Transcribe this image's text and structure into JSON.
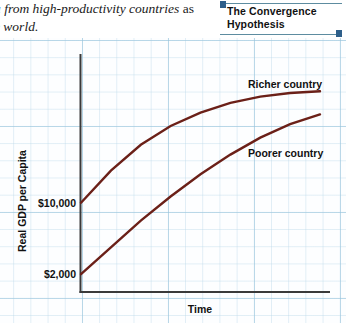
{
  "prose": {
    "line1": "a from high-productivity countries",
    "line1_tail": "as",
    "line2": "e world."
  },
  "callout": {
    "title": "The Convergence Hypothesis",
    "rule_color": "#5d8ca0",
    "marker_color": "#2e5f8a"
  },
  "chart_data": {
    "type": "line",
    "title": "The Convergence Hypothesis",
    "xlabel": "Time",
    "ylabel": "Real GDP per Capita",
    "grid": true,
    "legend_position": "inline-right",
    "x": [
      0,
      0.125,
      0.25,
      0.375,
      0.5,
      0.625,
      0.75,
      0.875,
      1.0
    ],
    "xlim": [
      0,
      1
    ],
    "ylim": [
      0,
      26000
    ],
    "ytick_labels": [
      "$10,000",
      "$2,000"
    ],
    "ytick_values": [
      10000,
      2000
    ],
    "line_color": "#6b2018",
    "axis_color": "#3a3a3a",
    "series": [
      {
        "name": "Richer country",
        "start_value": 10000,
        "end_value": 22500,
        "values": [
          10000,
          13600,
          16500,
          18600,
          20100,
          21200,
          21900,
          22300,
          22500
        ]
      },
      {
        "name": "Poorer country",
        "start_value": 2000,
        "end_value": 19900,
        "values": [
          2000,
          5000,
          8000,
          10700,
          13200,
          15400,
          17300,
          18800,
          19900
        ]
      }
    ]
  },
  "axis": {
    "x_label": "Time",
    "y_label": "Real GDP per Capita",
    "tick_high": "$10,000",
    "tick_low": "$2,000"
  },
  "labels": {
    "richer": "Richer country",
    "poorer": "Poorer country"
  }
}
